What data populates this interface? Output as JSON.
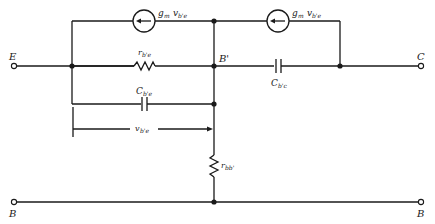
{
  "diagram": {
    "type": "hybrid-pi small-signal equivalent circuit (common-base)",
    "terminals": {
      "emitter": "E",
      "collector": "C",
      "base_left": "B",
      "base_right": "B"
    },
    "nodes": {
      "internal_base": "B'"
    },
    "components": {
      "source_left": {
        "label_main": "g",
        "label_sub": "m",
        "label_v": "v",
        "label_vsub": "b'e"
      },
      "source_right": {
        "label_main": "g",
        "label_sub": "m",
        "label_v": "v",
        "label_vsub": "b'e"
      },
      "r_be": {
        "label_main": "r",
        "label_sub": "b'e"
      },
      "c_be": {
        "label_main": "C",
        "label_sub": "b'e"
      },
      "c_bc": {
        "label_main": "C",
        "label_sub": "b'c"
      },
      "r_bb": {
        "label_main": "r",
        "label_sub": "bb'"
      }
    },
    "voltage": {
      "label_main": "v",
      "label_sub": "b'e"
    }
  }
}
